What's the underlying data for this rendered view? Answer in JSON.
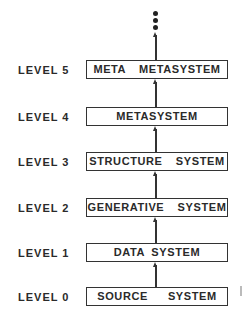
{
  "diagram": {
    "type": "hierarchy",
    "continuation": "more-levels-dots",
    "levels": [
      {
        "label": "LEVEL 5",
        "system": "META  METASYSTEM"
      },
      {
        "label": "LEVEL 4",
        "system": "METASYSTEM"
      },
      {
        "label": "LEVEL 3",
        "system": "STRUCTURE  SYSTEM"
      },
      {
        "label": "LEVEL 2",
        "system": "GENERATIVE  SYSTEM"
      },
      {
        "label": "LEVEL 1",
        "system": "DATA SYSTEM"
      },
      {
        "label": "LEVEL 0",
        "system": "SOURCE   SYSTEM"
      }
    ]
  }
}
